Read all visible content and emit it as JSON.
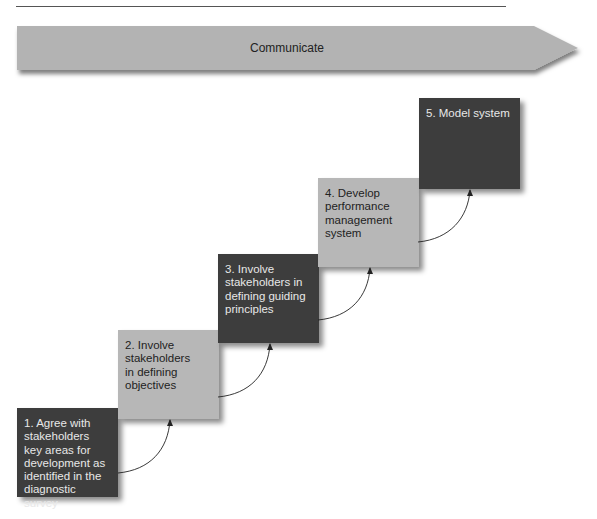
{
  "banner": {
    "label": "Communicate",
    "fill": "#b3b3b3"
  },
  "steps": [
    {
      "number": 1,
      "text": "1. Agree with\nstakeholders\nkey areas for\ndevelopment as\nidentified in the\ndiagnostic survey",
      "shade": "dark"
    },
    {
      "number": 2,
      "text": "2. Involve\nstakeholders\nin defining\nobjectives",
      "shade": "light"
    },
    {
      "number": 3,
      "text": "3. Involve\nstakeholders in\ndefining guiding\nprinciples",
      "shade": "dark"
    },
    {
      "number": 4,
      "text": "4. Develop\nperformance\nmanagement\nsystem",
      "shade": "light"
    },
    {
      "number": 5,
      "text": "5. Model system",
      "shade": "dark"
    }
  ],
  "colors": {
    "dark_box": "#3d3d3d",
    "light_box": "#b7b7b7",
    "connector": "#222222"
  }
}
